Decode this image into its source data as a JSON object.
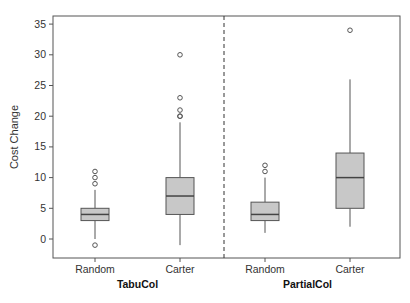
{
  "chart_data": {
    "type": "box",
    "title": "",
    "xlabel": "",
    "ylabel": "Cost Change",
    "ylim": [
      -3,
      36
    ],
    "yticks": [
      0,
      5,
      10,
      15,
      20,
      25,
      30,
      35
    ],
    "grid": false,
    "legend": null,
    "groups": [
      {
        "name": "TabuCol",
        "categories": [
          {
            "label": "Random",
            "whisker_low": 0,
            "q1": 3,
            "median": 4,
            "q3": 5,
            "whisker_high": 8,
            "outliers": [
              -1,
              9,
              10,
              11
            ]
          },
          {
            "label": "Carter",
            "whisker_low": -1,
            "q1": 4,
            "median": 7,
            "q3": 10,
            "whisker_high": 19,
            "outliers": [
              20,
              20,
              21,
              23,
              30
            ]
          }
        ]
      },
      {
        "name": "PartialCol",
        "categories": [
          {
            "label": "Random",
            "whisker_low": 1,
            "q1": 3,
            "median": 4,
            "q3": 6,
            "whisker_high": 10,
            "outliers": [
              11,
              12
            ]
          },
          {
            "label": "Carter",
            "whisker_low": 2,
            "q1": 5,
            "median": 10,
            "q3": 14,
            "whisker_high": 26,
            "outliers": [
              34
            ]
          }
        ]
      }
    ],
    "separator": "dashed vertical line between groups",
    "box_color": "#c8c8c8"
  }
}
